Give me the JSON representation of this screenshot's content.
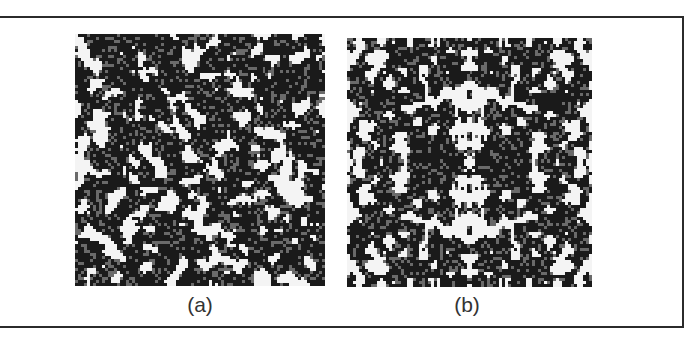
{
  "figure": {
    "panels": [
      {
        "id": "a",
        "label": "(a)",
        "description": "random binary texture pattern",
        "symmetry": "none",
        "seed": 1337,
        "grid": 84,
        "density": 0.47
      },
      {
        "id": "b",
        "label": "(b)",
        "description": "binary texture pattern with four-fold mirror symmetry",
        "symmetry": "mirror-xy",
        "seed": 4242,
        "grid": 82,
        "density": 0.44
      }
    ],
    "colors": {
      "ink": "#1a1a1a",
      "mid": "#6a6a6a",
      "paper": "#f4f4f4",
      "frame": "#2b2b2b"
    }
  }
}
